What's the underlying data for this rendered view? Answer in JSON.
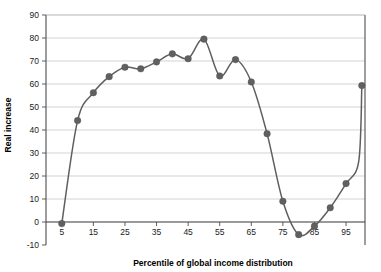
{
  "chart_data": {
    "type": "line",
    "title": "",
    "subtitle": "",
    "xlabel": "Percentile of global income distribution",
    "ylabel": "Real increase",
    "xlim": [
      0,
      101
    ],
    "ylim": [
      -10,
      90
    ],
    "xticks": [
      5,
      15,
      25,
      35,
      45,
      55,
      65,
      75,
      85,
      95
    ],
    "yticks": [
      -10,
      0,
      10,
      20,
      30,
      40,
      50,
      60,
      70,
      80,
      90
    ],
    "xtick_labels": [
      "5",
      "15",
      "25",
      "35",
      "45",
      "55",
      "65",
      "75",
      "85",
      "95"
    ],
    "ytick_labels": [
      "-10",
      "0",
      "10",
      "20",
      "30",
      "40",
      "50",
      "60",
      "70",
      "80",
      "90"
    ],
    "grid": "horizontal",
    "legend": "none",
    "marker": "circle",
    "series": [
      {
        "name": "Real increase",
        "color": "#606060",
        "x": [
          5,
          10,
          15,
          20,
          25,
          30,
          35,
          40,
          45,
          50,
          55,
          60,
          65,
          70,
          75,
          80,
          85,
          90,
          95,
          99,
          100
        ],
        "values": [
          -0.7,
          44.1,
          56.2,
          63.2,
          67.3,
          66.6,
          69.6,
          73.1,
          71.0,
          79.5,
          63.5,
          70.6,
          60.9,
          38.4,
          9.0,
          -5.5,
          -1.8,
          6.2,
          16.7,
          26.2,
          59.3
        ]
      }
    ]
  },
  "axis": {
    "y_title": "Real increase",
    "x_title": "Percentile of global income distribution"
  }
}
